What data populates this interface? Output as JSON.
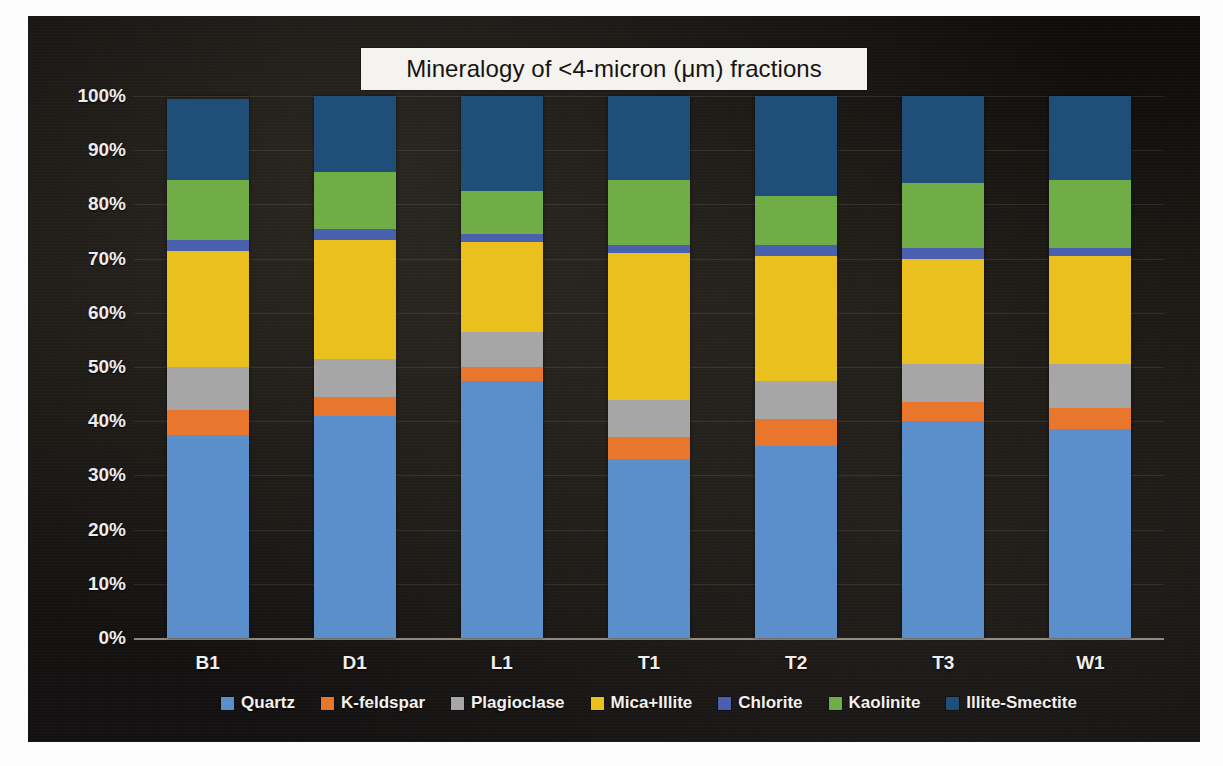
{
  "chart_data": {
    "type": "bar",
    "subtype": "stacked-percent",
    "title": "Mineralogy of <4-micron (μm) fractions",
    "xlabel": "",
    "ylabel": "",
    "ylim": [
      0,
      100
    ],
    "ytick_labels": [
      "100%",
      "90%",
      "80%",
      "70%",
      "60%",
      "50%",
      "40%",
      "30%",
      "20%",
      "10%",
      "0%"
    ],
    "ytick_values": [
      100,
      90,
      80,
      70,
      60,
      50,
      40,
      30,
      20,
      10,
      0
    ],
    "grid": true,
    "legend_position": "bottom",
    "categories": [
      "B1",
      "D1",
      "L1",
      "T1",
      "T2",
      "T3",
      "W1"
    ],
    "series": [
      {
        "name": "Quartz",
        "color": "#5B8FCB",
        "values": [
          37.5,
          41.0,
          47.5,
          33.0,
          35.5,
          40.0,
          38.5
        ]
      },
      {
        "name": "K-feldspar",
        "color": "#E8762C",
        "values": [
          4.5,
          3.5,
          2.5,
          4.0,
          5.0,
          3.5,
          4.0
        ]
      },
      {
        "name": "Plagioclase",
        "color": "#A6A6A6",
        "values": [
          8.0,
          7.0,
          6.5,
          7.0,
          7.0,
          7.0,
          8.0
        ]
      },
      {
        "name": "Mica+Illite",
        "color": "#E9C01E",
        "values": [
          21.5,
          22.0,
          16.5,
          27.0,
          23.0,
          19.5,
          20.0
        ]
      },
      {
        "name": "Chlorite",
        "color": "#4A5FAE",
        "values": [
          2.0,
          2.0,
          1.5,
          1.5,
          2.0,
          2.0,
          1.5
        ]
      },
      {
        "name": "Kaolinite",
        "color": "#70AD47",
        "values": [
          11.0,
          10.5,
          8.0,
          12.0,
          9.0,
          12.0,
          12.5
        ]
      },
      {
        "name": "Illite-Smectite",
        "color": "#1F4E79",
        "values": [
          15.0,
          14.0,
          17.5,
          15.5,
          18.5,
          16.0,
          15.5
        ]
      }
    ]
  },
  "legend": {
    "items": [
      {
        "label": "Quartz",
        "color": "#5B8FCB"
      },
      {
        "label": "K-feldspar",
        "color": "#E8762C"
      },
      {
        "label": "Plagioclase",
        "color": "#A6A6A6"
      },
      {
        "label": "Mica+Illite",
        "color": "#E9C01E"
      },
      {
        "label": "Chlorite",
        "color": "#4A5FAE"
      },
      {
        "label": "Kaolinite",
        "color": "#70AD47"
      },
      {
        "label": "Illite-Smectite",
        "color": "#1F4E79"
      }
    ]
  },
  "colors": {
    "panel_background": "#141210",
    "title_background": "#f5f3ef",
    "title_text": "#17140f",
    "tick_text": "#ececec",
    "gridline": "rgba(190,185,170,.13)",
    "axis_line": "rgba(215,210,195,.62)"
  }
}
